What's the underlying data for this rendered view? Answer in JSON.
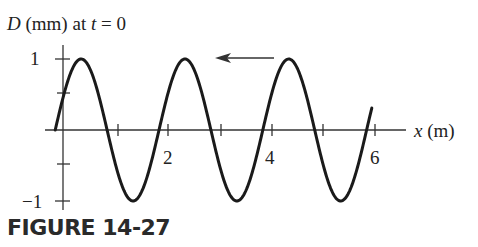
{
  "figure": {
    "caption": "FIGURE 14-27",
    "ylabel_var": "D",
    "ylabel_rest": " (mm) at ",
    "ylabel_t": "t",
    "ylabel_eq": " = 0",
    "xlabel_var": "x",
    "xlabel_unit": " (m)",
    "y_ticks": {
      "top": "1",
      "bottom": "−1"
    },
    "x_ticks": {
      "t2": "2",
      "t4": "4",
      "t6": "6"
    },
    "direction_arrow": "left"
  },
  "chart_data": {
    "type": "line",
    "title": "D (mm) at t = 0",
    "xlabel": "x (m)",
    "ylabel": "D (mm)",
    "xlim": [
      -0.4,
      6.6
    ],
    "ylim": [
      -1,
      1
    ],
    "x_tick_labels": [
      "2",
      "4",
      "6"
    ],
    "x_ticks_minor": [
      1,
      2,
      3,
      4,
      5,
      6
    ],
    "y_tick_labels": [
      "1",
      "-1"
    ],
    "y_ticks_minor": [
      1,
      0.5,
      -0.5,
      -1
    ],
    "grid": false,
    "series": [
      {
        "name": "D(x, t=0)",
        "function": "sinusoid",
        "amplitude_mm": 1,
        "wavelength_m": 2.0,
        "x_start": -0.15,
        "x_end": 5.95,
        "points": [
          {
            "x": -0.15,
            "y": 0
          },
          {
            "x": 0.33,
            "y": 1
          },
          {
            "x": 0.85,
            "y": 0
          },
          {
            "x": 1.33,
            "y": -1
          },
          {
            "x": 1.85,
            "y": 0
          },
          {
            "x": 2.33,
            "y": 1
          },
          {
            "x": 2.85,
            "y": 0
          },
          {
            "x": 3.33,
            "y": -1
          },
          {
            "x": 3.85,
            "y": 0
          },
          {
            "x": 4.33,
            "y": 1
          },
          {
            "x": 4.85,
            "y": 0
          },
          {
            "x": 5.33,
            "y": -1
          },
          {
            "x": 5.85,
            "y": 0
          },
          {
            "x": 5.95,
            "y": 0.6
          }
        ]
      }
    ],
    "annotations": [
      "Arrow pointing left (wave travels in -x direction)"
    ],
    "caption": "FIGURE 14-27"
  }
}
